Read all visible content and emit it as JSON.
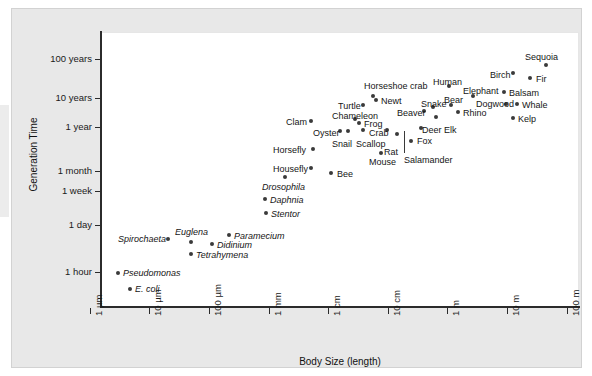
{
  "figure": {
    "background_color": "#e8e8e8",
    "plot_background_color": "#ffffff",
    "point_color": "#3a3a3a",
    "axis_color": "#2b2b2b"
  },
  "chart_data": {
    "type": "scatter",
    "title": "",
    "xlabel": "Body Size (length)",
    "ylabel": "Generation Time",
    "grid": false,
    "legend": null,
    "x_scale": "log",
    "y_scale": "log",
    "x_tick_labels": [
      "1 µm",
      "10 µm",
      "100 µm",
      "1 mm",
      "1 cm",
      "10 cm",
      "1 m",
      "10 m",
      "100 m"
    ],
    "y_tick_labels": [
      "100 years",
      "10 years",
      "1 year",
      "1 month",
      "1 week",
      "1 day",
      "1 hour"
    ],
    "xlim": [
      "1 µm",
      "100 m"
    ],
    "ylim": [
      "below 1 hour",
      "above 100 years"
    ],
    "points": [
      {
        "label": "E. coli",
        "italic": true,
        "px": 129,
        "py": 288,
        "lx": 134,
        "ly": 284,
        "body_size": "2 µm",
        "generation_time": "20 minutes"
      },
      {
        "label": "Pseudomonas",
        "italic": true,
        "px": 117,
        "py": 272,
        "lx": 122,
        "ly": 268,
        "body_size": "1.5 µm",
        "generation_time": "1 hour"
      },
      {
        "label": "Spirochaeta",
        "italic": true,
        "px": 167,
        "py": 238,
        "lx": 117,
        "ly": 234,
        "body_size": "15 µm",
        "generation_time": "5 hours"
      },
      {
        "label": "Euglena",
        "italic": true,
        "px": 190,
        "py": 241,
        "lx": 174,
        "ly": 227,
        "body_size": "40 µm",
        "generation_time": "4 hours"
      },
      {
        "label": "Paramecium",
        "italic": true,
        "px": 228,
        "py": 234,
        "lx": 233,
        "ly": 231,
        "body_size": "200 µm",
        "generation_time": "6 hours"
      },
      {
        "label": "Didinium",
        "italic": true,
        "px": 211,
        "py": 243,
        "lx": 216,
        "ly": 240,
        "body_size": "120 µm",
        "generation_time": "5 hours"
      },
      {
        "label": "Tetrahymena",
        "italic": true,
        "px": 190,
        "py": 253,
        "lx": 195,
        "ly": 250,
        "body_size": "50 µm",
        "generation_time": "3 hours"
      },
      {
        "label": "Stentor",
        "italic": true,
        "px": 265,
        "py": 212,
        "lx": 270,
        "ly": 209,
        "body_size": "1 mm",
        "generation_time": "1 day"
      },
      {
        "label": "Daphnia",
        "italic": true,
        "px": 264,
        "py": 198,
        "lx": 269,
        "ly": 195,
        "body_size": "1.5 mm",
        "generation_time": "2 days"
      },
      {
        "label": "Drosophila",
        "italic": true,
        "px": 284,
        "py": 176,
        "lx": 261,
        "ly": 182,
        "body_size": "3 mm",
        "generation_time": "2 weeks"
      },
      {
        "label": "Housefly",
        "italic": false,
        "px": 310,
        "py": 167,
        "lx": 272,
        "ly": 164,
        "body_size": "7 mm",
        "generation_time": "3 weeks"
      },
      {
        "label": "Bee",
        "italic": false,
        "px": 330,
        "py": 172,
        "lx": 336,
        "ly": 169,
        "body_size": "1.5 cm",
        "generation_time": "1 month"
      },
      {
        "label": "Horsefly",
        "italic": false,
        "px": 312,
        "py": 148,
        "lx": 272,
        "ly": 145,
        "body_size": "1 cm",
        "generation_time": "2 months"
      },
      {
        "label": "Mouse",
        "italic": false,
        "px": 380,
        "py": 152,
        "lx": 368,
        "ly": 157,
        "body_size": "8 cm",
        "generation_time": "2 months"
      },
      {
        "label": "Clam",
        "italic": false,
        "px": 310,
        "py": 120,
        "lx": 285,
        "ly": 117,
        "body_size": "8 cm",
        "generation_time": "1.5 years"
      },
      {
        "label": "Oyster",
        "italic": false,
        "px": 339,
        "py": 130,
        "lx": 312,
        "ly": 128,
        "body_size": "10 cm",
        "generation_time": "1 year"
      },
      {
        "label": "Snail",
        "italic": false,
        "px": 347,
        "py": 130,
        "lx": 331,
        "ly": 139,
        "body_size": "4 cm",
        "generation_time": "1 year"
      },
      {
        "label": "Scallop",
        "italic": false,
        "px": 362,
        "py": 129,
        "lx": 355,
        "ly": 139,
        "body_size": "10 cm",
        "generation_time": "1 year"
      },
      {
        "label": "Chameleon",
        "italic": false,
        "px": 354,
        "py": 118,
        "lx": 331,
        "ly": 111,
        "body_size": "20 cm",
        "generation_time": "1.5 years"
      },
      {
        "label": "Frog",
        "italic": false,
        "px": 358,
        "py": 122,
        "lx": 363,
        "ly": 119,
        "body_size": "8 cm",
        "generation_time": "1.5 years"
      },
      {
        "label": "Crab",
        "italic": false,
        "px": 386,
        "py": 129,
        "lx": 368,
        "ly": 128,
        "body_size": "12 cm",
        "generation_time": "1 year"
      },
      {
        "label": "Rat",
        "italic": false,
        "px": 396,
        "py": 133,
        "lx": 383,
        "ly": 147,
        "body_size": "20 cm",
        "generation_time": "8 months"
      },
      {
        "label": "Salamander",
        "italic": false,
        "px": 410,
        "py": 140,
        "lx": 403,
        "ly": 155,
        "body_size": "20 cm",
        "generation_time": "1 year"
      },
      {
        "label": "Fox",
        "italic": false,
        "px": 420,
        "py": 127,
        "lx": 416,
        "ly": 136,
        "body_size": "70 cm",
        "generation_time": "1.5 years"
      },
      {
        "label": "Newt",
        "italic": false,
        "px": 375,
        "py": 99,
        "lx": 380,
        "ly": 96,
        "body_size": "12 cm",
        "generation_time": "3 years"
      },
      {
        "label": "Turtle",
        "italic": false,
        "px": 362,
        "py": 104,
        "lx": 337,
        "ly": 101,
        "body_size": "30 cm",
        "generation_time": "3 years"
      },
      {
        "label": "Horseshoe crab",
        "italic": false,
        "px": 372,
        "py": 95,
        "lx": 363,
        "ly": 81,
        "body_size": "40 cm",
        "generation_time": "4 years"
      },
      {
        "label": "Beaver",
        "italic": false,
        "px": 423,
        "py": 110,
        "lx": 396,
        "ly": 108,
        "body_size": "80 cm",
        "generation_time": "2.5 years"
      },
      {
        "label": "Snake",
        "italic": false,
        "px": 432,
        "py": 106,
        "lx": 420,
        "ly": 99,
        "body_size": "1 m",
        "generation_time": "3 years"
      },
      {
        "label": "Deer Elk",
        "italic": false,
        "px": 435,
        "py": 116,
        "lx": 421,
        "ly": 125,
        "body_size": "2 m",
        "generation_time": "2 years"
      },
      {
        "label": "Bear",
        "italic": false,
        "px": 450,
        "py": 104,
        "lx": 443,
        "ly": 95,
        "body_size": "2 m",
        "generation_time": "4 years"
      },
      {
        "label": "Rhino",
        "italic": false,
        "px": 457,
        "py": 111,
        "lx": 462,
        "ly": 108,
        "body_size": "3.5 m",
        "generation_time": "3 years"
      },
      {
        "label": "Human",
        "italic": false,
        "px": 448,
        "py": 85,
        "lx": 432,
        "ly": 77,
        "body_size": "1.7 m",
        "generation_time": "15 years"
      },
      {
        "label": "Elephant",
        "italic": false,
        "px": 472,
        "py": 95,
        "lx": 462,
        "ly": 86,
        "body_size": "5 m",
        "generation_time": "10 years"
      },
      {
        "label": "Dogwood",
        "italic": false,
        "px": 505,
        "py": 103,
        "lx": 475,
        "ly": 99,
        "body_size": "6 m",
        "generation_time": "5 years"
      },
      {
        "label": "Whale",
        "italic": false,
        "px": 516,
        "py": 103,
        "lx": 521,
        "ly": 100,
        "body_size": "25 m",
        "generation_time": "6 years"
      },
      {
        "label": "Kelp",
        "italic": false,
        "px": 512,
        "py": 117,
        "lx": 517,
        "ly": 114,
        "body_size": "30 m",
        "generation_time": "2 years"
      },
      {
        "label": "Balsam",
        "italic": false,
        "px": 503,
        "py": 91,
        "lx": 508,
        "ly": 88,
        "body_size": "20 m",
        "generation_time": "12 years"
      },
      {
        "label": "Birch",
        "italic": false,
        "px": 512,
        "py": 72,
        "lx": 489,
        "ly": 70,
        "body_size": "20 m",
        "generation_time": "30 years"
      },
      {
        "label": "Fir",
        "italic": false,
        "px": 529,
        "py": 77,
        "lx": 535,
        "ly": 74,
        "body_size": "30 m",
        "generation_time": "25 years"
      },
      {
        "label": "Sequoia",
        "italic": false,
        "px": 545,
        "py": 64,
        "lx": 524,
        "ly": 52,
        "body_size": "80 m",
        "generation_time": "60 years"
      }
    ]
  }
}
